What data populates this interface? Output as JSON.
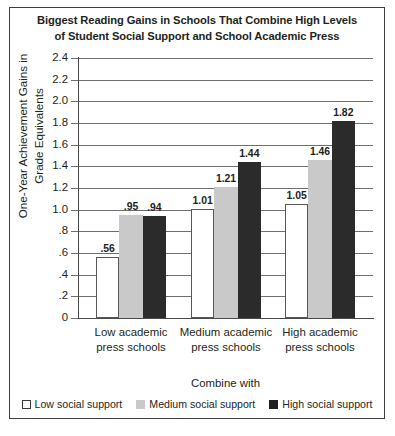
{
  "chart_data": {
    "type": "bar",
    "title": "Biggest Reading Gains in Schools That Combine High Levels of Student Social Support and School Academic Press",
    "title_lines": [
      "Biggest Reading Gains in Schools That Combine High Levels",
      "of Student Social Support and School Academic Press"
    ],
    "categories": [
      "Low academic press schools",
      "Medium academic press schools",
      "High academic press schools"
    ],
    "category_lines": [
      [
        "Low academic",
        "press schools"
      ],
      [
        "Medium academic",
        "press schools"
      ],
      [
        "High academic",
        "press schools"
      ]
    ],
    "series": [
      {
        "name": "Low social support",
        "color": "#ffffff",
        "values": [
          0.56,
          1.01,
          1.05
        ],
        "labels": [
          ".56",
          "1.01",
          "1.05"
        ]
      },
      {
        "name": "Medium social support",
        "color": "#c9c9c9",
        "values": [
          0.95,
          1.21,
          1.46
        ],
        "labels": [
          ".95",
          "1.21",
          "1.46"
        ]
      },
      {
        "name": "High social support",
        "color": "#2b2b2b",
        "values": [
          0.94,
          1.44,
          1.82
        ],
        "labels": [
          ".94",
          "1.44",
          "1.82"
        ]
      }
    ],
    "xlabel": "Combine with",
    "ylabel": "One-Year Achievement Gains in Grade Equivalents",
    "ylabel_lines": [
      "One-Year Achievement Gains in",
      "Grade Equivalents"
    ],
    "ylim": [
      0,
      2.4
    ],
    "ytick_values": [
      0,
      0.2,
      0.4,
      0.6,
      0.8,
      1.0,
      1.2,
      1.4,
      1.6,
      1.8,
      2.0,
      2.2,
      2.4
    ],
    "ytick_labels": [
      "0",
      ".2",
      ".4",
      ".6",
      ".8",
      "1.0",
      "1.2",
      "1.4",
      "1.6",
      "1.8",
      "2.0",
      "2.2",
      "2.4"
    ],
    "grid": true,
    "legend_position": "bottom"
  },
  "legend": {
    "items": [
      {
        "label": "Low social support"
      },
      {
        "label": "Medium social support"
      },
      {
        "label": "High social support"
      }
    ]
  }
}
